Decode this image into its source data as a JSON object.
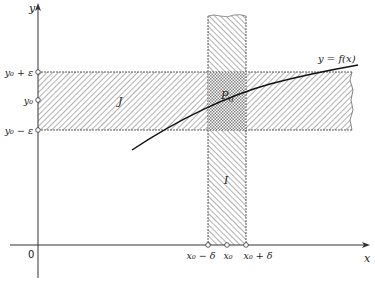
{
  "diagram": {
    "type": "epsilon-delta continuity illustration",
    "axes": {
      "x_label": "x",
      "y_label": "y",
      "origin_label": "0"
    },
    "y_ticks": {
      "upper": "y₀ + ε",
      "center": "y₀",
      "lower": "y₀ − ε"
    },
    "x_ticks": {
      "left": "x₀ − δ",
      "center": "x₀",
      "right": "x₀ + δ"
    },
    "regions": {
      "horizontal_band_label": "J",
      "vertical_band_label": "I"
    },
    "point_label": "P",
    "point_subscript": "0",
    "curve_label": "y = f(x)",
    "colors": {
      "ink": "#222222",
      "hatch": "#555555",
      "background": "#ffffff"
    }
  }
}
